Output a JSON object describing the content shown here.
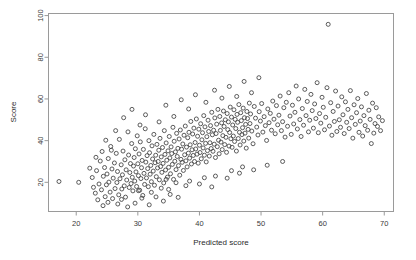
{
  "chart_data": {
    "type": "scatter",
    "title": "",
    "xlabel": "Predicted score",
    "ylabel": "Score",
    "xlim": [
      15.5,
      71.5
    ],
    "ylim": [
      6,
      101
    ],
    "xticks": [
      20,
      30,
      40,
      50,
      60,
      70
    ],
    "yticks": [
      20,
      40,
      60,
      80,
      100
    ],
    "xtick_labels": [
      "20",
      "30",
      "40",
      "50",
      "60",
      "70"
    ],
    "ytick_labels": [
      "20",
      "40",
      "60",
      "80",
      "100"
    ],
    "grid": false,
    "legend": false,
    "marker": "open-circle",
    "marker_size": 4,
    "marker_color": "#404040",
    "n_points": 402,
    "points": [
      [
        17.2,
        20.4
      ],
      [
        20.4,
        20.0
      ],
      [
        22.6,
        22.3
      ],
      [
        22.8,
        17.6
      ],
      [
        23.1,
        14.8
      ],
      [
        23.3,
        25.6
      ],
      [
        23.5,
        11.6
      ],
      [
        23.7,
        19.2
      ],
      [
        23.9,
        30.2
      ],
      [
        24.1,
        16.4
      ],
      [
        24.2,
        34.8
      ],
      [
        24.4,
        22.9
      ],
      [
        24.6,
        27.1
      ],
      [
        24.7,
        13.1
      ],
      [
        24.9,
        18.8
      ],
      [
        25.0,
        24.0
      ],
      [
        25.2,
        31.4
      ],
      [
        25.3,
        20.1
      ],
      [
        25.5,
        15.3
      ],
      [
        25.6,
        37.2
      ],
      [
        25.8,
        26.4
      ],
      [
        25.9,
        12.2
      ],
      [
        26.0,
        22.0
      ],
      [
        26.2,
        29.3
      ],
      [
        26.3,
        17.0
      ],
      [
        26.5,
        33.9
      ],
      [
        26.6,
        19.9
      ],
      [
        26.7,
        25.2
      ],
      [
        26.9,
        14.0
      ],
      [
        27.0,
        40.6
      ],
      [
        27.1,
        21.7
      ],
      [
        27.3,
        28.4
      ],
      [
        27.4,
        16.8
      ],
      [
        27.5,
        23.6
      ],
      [
        27.6,
        35.0
      ],
      [
        27.8,
        18.3
      ],
      [
        27.9,
        30.8
      ],
      [
        28.0,
        12.9
      ],
      [
        28.1,
        26.0
      ],
      [
        28.2,
        21.1
      ],
      [
        28.4,
        44.2
      ],
      [
        28.5,
        33.1
      ],
      [
        28.6,
        17.5
      ],
      [
        28.7,
        24.7
      ],
      [
        28.8,
        29.0
      ],
      [
        28.9,
        19.4
      ],
      [
        29.0,
        38.6
      ],
      [
        29.1,
        22.4
      ],
      [
        29.2,
        15.9
      ],
      [
        29.3,
        27.8
      ],
      [
        29.4,
        31.9
      ],
      [
        29.5,
        20.6
      ],
      [
        29.6,
        36.1
      ],
      [
        29.7,
        25.0
      ],
      [
        29.8,
        18.0
      ],
      [
        29.9,
        42.3
      ],
      [
        30.0,
        28.9
      ],
      [
        30.1,
        23.2
      ],
      [
        30.2,
        33.6
      ],
      [
        30.3,
        16.2
      ],
      [
        30.4,
        39.4
      ],
      [
        30.5,
        21.8
      ],
      [
        30.6,
        27.0
      ],
      [
        30.7,
        30.5
      ],
      [
        30.8,
        13.7
      ],
      [
        30.9,
        35.8
      ],
      [
        31.0,
        24.3
      ],
      [
        31.1,
        19.0
      ],
      [
        31.2,
        45.7
      ],
      [
        31.3,
        29.7
      ],
      [
        31.4,
        22.1
      ],
      [
        31.5,
        32.8
      ],
      [
        31.6,
        26.6
      ],
      [
        31.7,
        17.9
      ],
      [
        31.8,
        40.0
      ],
      [
        31.9,
        34.2
      ],
      [
        32.0,
        23.9
      ],
      [
        32.1,
        28.1
      ],
      [
        32.2,
        20.3
      ],
      [
        32.3,
        37.5
      ],
      [
        32.4,
        31.2
      ],
      [
        32.5,
        25.4
      ],
      [
        32.6,
        43.0
      ],
      [
        32.7,
        18.6
      ],
      [
        32.8,
        29.4
      ],
      [
        32.9,
        33.0
      ],
      [
        33.0,
        22.7
      ],
      [
        33.1,
        38.2
      ],
      [
        33.2,
        26.9
      ],
      [
        33.3,
        30.0
      ],
      [
        33.4,
        35.4
      ],
      [
        33.5,
        21.2
      ],
      [
        33.6,
        41.1
      ],
      [
        33.7,
        27.6
      ],
      [
        33.8,
        32.2
      ],
      [
        33.9,
        24.8
      ],
      [
        34.0,
        36.7
      ],
      [
        34.1,
        29.1
      ],
      [
        34.2,
        19.7
      ],
      [
        34.3,
        44.8
      ],
      [
        34.4,
        33.4
      ],
      [
        34.5,
        25.9
      ],
      [
        34.6,
        38.9
      ],
      [
        34.7,
        30.6
      ],
      [
        34.8,
        22.5
      ],
      [
        34.9,
        35.1
      ],
      [
        35.0,
        27.2
      ],
      [
        35.1,
        42.0
      ],
      [
        35.2,
        31.7
      ],
      [
        35.3,
        24.1
      ],
      [
        35.4,
        37.0
      ],
      [
        35.5,
        33.8
      ],
      [
        35.6,
        28.6
      ],
      [
        35.7,
        46.4
      ],
      [
        35.8,
        21.4
      ],
      [
        35.9,
        39.7
      ],
      [
        36.0,
        30.1
      ],
      [
        36.1,
        34.6
      ],
      [
        36.2,
        26.1
      ],
      [
        36.3,
        43.5
      ],
      [
        36.4,
        32.4
      ],
      [
        36.5,
        36.3
      ],
      [
        36.6,
        28.0
      ],
      [
        36.7,
        40.8
      ],
      [
        36.8,
        23.4
      ],
      [
        36.9,
        45.1
      ],
      [
        37.0,
        31.0
      ],
      [
        37.1,
        35.9
      ],
      [
        37.2,
        29.6
      ],
      [
        37.3,
        38.4
      ],
      [
        37.4,
        25.7
      ],
      [
        37.5,
        42.6
      ],
      [
        37.6,
        33.2
      ],
      [
        37.7,
        47.0
      ],
      [
        37.8,
        30.3
      ],
      [
        37.9,
        36.9
      ],
      [
        38.0,
        27.4
      ],
      [
        38.1,
        41.4
      ],
      [
        38.2,
        34.0
      ],
      [
        38.3,
        44.0
      ],
      [
        38.4,
        31.6
      ],
      [
        38.5,
        38.0
      ],
      [
        38.6,
        49.2
      ],
      [
        38.7,
        28.8
      ],
      [
        38.8,
        35.6
      ],
      [
        38.9,
        43.2
      ],
      [
        39.0,
        32.9
      ],
      [
        39.1,
        46.0
      ],
      [
        39.2,
        30.0
      ],
      [
        39.3,
        39.1
      ],
      [
        39.4,
        36.0
      ],
      [
        39.5,
        50.4
      ],
      [
        39.6,
        33.5
      ],
      [
        39.7,
        42.1
      ],
      [
        39.8,
        29.2
      ],
      [
        39.9,
        45.5
      ],
      [
        40.0,
        37.8
      ],
      [
        40.1,
        34.3
      ],
      [
        40.2,
        48.1
      ],
      [
        40.3,
        31.3
      ],
      [
        40.4,
        40.4
      ],
      [
        40.5,
        43.8
      ],
      [
        40.6,
        36.5
      ],
      [
        40.7,
        52.0
      ],
      [
        40.8,
        33.0
      ],
      [
        40.9,
        46.6
      ],
      [
        41.0,
        38.7
      ],
      [
        41.1,
        29.8
      ],
      [
        41.2,
        41.9
      ],
      [
        41.3,
        35.2
      ],
      [
        41.4,
        49.8
      ],
      [
        41.5,
        44.4
      ],
      [
        41.6,
        32.6
      ],
      [
        41.7,
        39.0
      ],
      [
        41.8,
        47.2
      ],
      [
        41.9,
        36.2
      ],
      [
        42.0,
        53.6
      ],
      [
        42.1,
        42.8
      ],
      [
        42.2,
        34.9
      ],
      [
        42.3,
        45.0
      ],
      [
        42.4,
        38.3
      ],
      [
        42.5,
        50.9
      ],
      [
        42.6,
        31.9
      ],
      [
        42.7,
        43.4
      ],
      [
        42.8,
        47.9
      ],
      [
        42.9,
        37.1
      ],
      [
        43.0,
        55.0
      ],
      [
        43.1,
        40.2
      ],
      [
        43.2,
        33.7
      ],
      [
        43.3,
        51.6
      ],
      [
        43.4,
        44.9
      ],
      [
        43.5,
        39.3
      ],
      [
        43.6,
        48.5
      ],
      [
        43.7,
        35.7
      ],
      [
        43.8,
        42.4
      ],
      [
        43.9,
        54.2
      ],
      [
        44.0,
        46.8
      ],
      [
        44.1,
        38.1
      ],
      [
        44.2,
        50.0
      ],
      [
        44.3,
        41.6
      ],
      [
        44.4,
        34.4
      ],
      [
        44.5,
        53.0
      ],
      [
        44.6,
        45.3
      ],
      [
        44.7,
        49.0
      ],
      [
        44.8,
        37.4
      ],
      [
        44.9,
        43.9
      ],
      [
        45.0,
        56.1
      ],
      [
        45.1,
        40.9
      ],
      [
        45.2,
        51.3
      ],
      [
        45.3,
        36.8
      ],
      [
        45.4,
        47.5
      ],
      [
        45.5,
        42.2
      ],
      [
        45.6,
        54.8
      ],
      [
        45.7,
        39.6
      ],
      [
        45.8,
        50.2
      ],
      [
        45.9,
        45.8
      ],
      [
        46.0,
        35.0
      ],
      [
        46.1,
        52.6
      ],
      [
        46.2,
        48.8
      ],
      [
        46.3,
        41.0
      ],
      [
        46.4,
        57.3
      ],
      [
        46.5,
        44.0
      ],
      [
        46.6,
        37.9
      ],
      [
        46.7,
        53.4
      ],
      [
        46.8,
        49.6
      ],
      [
        46.9,
        42.9
      ],
      [
        47.0,
        46.2
      ],
      [
        47.1,
        55.6
      ],
      [
        47.2,
        39.8
      ],
      [
        47.3,
        51.0
      ],
      [
        47.4,
        43.6
      ],
      [
        47.5,
        47.8
      ],
      [
        47.6,
        36.4
      ],
      [
        47.7,
        54.0
      ],
      [
        47.8,
        50.6
      ],
      [
        47.9,
        45.4
      ],
      [
        48.0,
        41.2
      ],
      [
        48.1,
        58.0
      ],
      [
        48.2,
        48.2
      ],
      [
        48.3,
        52.8
      ],
      [
        48.5,
        44.6
      ],
      [
        48.7,
        38.5
      ],
      [
        48.9,
        56.4
      ],
      [
        49.1,
        50.8
      ],
      [
        49.3,
        46.5
      ],
      [
        49.5,
        42.7
      ],
      [
        49.7,
        53.9
      ],
      [
        49.9,
        49.4
      ],
      [
        50.1,
        57.8
      ],
      [
        50.3,
        44.1
      ],
      [
        50.5,
        51.5
      ],
      [
        50.7,
        47.2
      ],
      [
        50.9,
        40.1
      ],
      [
        51.1,
        55.2
      ],
      [
        51.3,
        48.6
      ],
      [
        51.5,
        53.1
      ],
      [
        51.7,
        45.0
      ],
      [
        51.9,
        59.0
      ],
      [
        52.1,
        50.3
      ],
      [
        52.3,
        43.3
      ],
      [
        52.5,
        56.8
      ],
      [
        52.7,
        47.6
      ],
      [
        52.9,
        52.2
      ],
      [
        53.1,
        61.4
      ],
      [
        53.3,
        44.8
      ],
      [
        53.5,
        49.1
      ],
      [
        53.7,
        55.8
      ],
      [
        53.9,
        41.7
      ],
      [
        54.1,
        58.4
      ],
      [
        54.3,
        46.9
      ],
      [
        54.5,
        63.0
      ],
      [
        54.7,
        51.8
      ],
      [
        54.9,
        43.0
      ],
      [
        55.1,
        57.0
      ],
      [
        55.3,
        48.0
      ],
      [
        55.5,
        53.6
      ],
      [
        55.7,
        66.2
      ],
      [
        55.9,
        45.6
      ],
      [
        56.1,
        60.0
      ],
      [
        56.3,
        50.1
      ],
      [
        56.5,
        42.0
      ],
      [
        56.7,
        55.4
      ],
      [
        56.9,
        47.4
      ],
      [
        57.1,
        64.6
      ],
      [
        57.3,
        52.0
      ],
      [
        57.5,
        58.8
      ],
      [
        57.7,
        44.2
      ],
      [
        57.9,
        49.8
      ],
      [
        58.1,
        62.2
      ],
      [
        58.3,
        54.4
      ],
      [
        58.5,
        46.0
      ],
      [
        58.7,
        57.6
      ],
      [
        58.9,
        50.6
      ],
      [
        59.1,
        67.8
      ],
      [
        59.3,
        43.8
      ],
      [
        59.5,
        53.0
      ],
      [
        59.7,
        48.4
      ],
      [
        59.9,
        60.8
      ],
      [
        60.1,
        56.0
      ],
      [
        60.3,
        45.2
      ],
      [
        60.5,
        51.2
      ],
      [
        60.7,
        65.4
      ],
      [
        60.9,
        95.8
      ],
      [
        61.1,
        47.0
      ],
      [
        61.3,
        58.2
      ],
      [
        61.5,
        42.6
      ],
      [
        61.7,
        54.0
      ],
      [
        61.9,
        49.2
      ],
      [
        62.1,
        63.8
      ],
      [
        62.3,
        44.4
      ],
      [
        62.5,
        56.6
      ],
      [
        62.7,
        50.0
      ],
      [
        62.9,
        46.4
      ],
      [
        63.1,
        61.0
      ],
      [
        63.3,
        52.4
      ],
      [
        63.5,
        43.4
      ],
      [
        63.7,
        58.6
      ],
      [
        63.9,
        48.8
      ],
      [
        64.1,
        55.0
      ],
      [
        64.3,
        45.8
      ],
      [
        64.5,
        64.0
      ],
      [
        64.7,
        51.0
      ],
      [
        64.9,
        41.2
      ],
      [
        65.1,
        57.2
      ],
      [
        65.3,
        47.8
      ],
      [
        65.5,
        53.4
      ],
      [
        65.7,
        60.2
      ],
      [
        65.9,
        44.0
      ],
      [
        66.1,
        49.4
      ],
      [
        66.3,
        56.2
      ],
      [
        66.5,
        42.2
      ],
      [
        66.7,
        52.0
      ],
      [
        66.9,
        47.2
      ],
      [
        67.1,
        62.6
      ],
      [
        67.3,
        45.0
      ],
      [
        67.5,
        54.6
      ],
      [
        67.7,
        50.2
      ],
      [
        67.9,
        38.6
      ],
      [
        68.1,
        58.0
      ],
      [
        68.3,
        43.6
      ],
      [
        68.5,
        48.2
      ],
      [
        68.7,
        55.8
      ],
      [
        68.9,
        46.8
      ],
      [
        69.1,
        51.4
      ],
      [
        69.4,
        44.8
      ],
      [
        69.7,
        49.6
      ],
      [
        26.4,
        44.8
      ],
      [
        27.7,
        51.0
      ],
      [
        29.05,
        55.0
      ],
      [
        30.35,
        47.5
      ],
      [
        31.25,
        52.4
      ],
      [
        33.45,
        49.0
      ],
      [
        34.55,
        57.0
      ],
      [
        35.85,
        51.6
      ],
      [
        37.05,
        59.6
      ],
      [
        38.25,
        55.2
      ],
      [
        39.35,
        62.0
      ],
      [
        41.05,
        58.4
      ],
      [
        42.45,
        64.2
      ],
      [
        43.65,
        60.4
      ],
      [
        44.85,
        66.0
      ],
      [
        46.05,
        61.2
      ],
      [
        47.25,
        68.4
      ],
      [
        48.45,
        63.0
      ],
      [
        49.65,
        70.2
      ],
      [
        24.8,
        40.2
      ],
      [
        25.7,
        35.4
      ],
      [
        22.2,
        26.8
      ],
      [
        23.2,
        32.0
      ],
      [
        24.35,
        8.8
      ],
      [
        25.15,
        10.4
      ],
      [
        26.75,
        9.6
      ],
      [
        27.35,
        11.8
      ],
      [
        28.35,
        8.2
      ],
      [
        29.55,
        10.0
      ],
      [
        30.65,
        12.4
      ],
      [
        31.85,
        9.2
      ],
      [
        32.95,
        13.0
      ],
      [
        34.15,
        11.0
      ],
      [
        35.25,
        14.2
      ],
      [
        36.55,
        12.8
      ],
      [
        30.1,
        16.0
      ],
      [
        32.2,
        15.2
      ],
      [
        33.8,
        17.2
      ],
      [
        35.0,
        16.6
      ],
      [
        37.8,
        18.4
      ],
      [
        40.0,
        19.2
      ],
      [
        42.0,
        17.8
      ],
      [
        44.5,
        22.0
      ],
      [
        46.5,
        24.4
      ],
      [
        48.8,
        26.0
      ],
      [
        51.0,
        28.2
      ],
      [
        53.5,
        30.0
      ],
      [
        38.4,
        20.6
      ],
      [
        36.2,
        19.8
      ],
      [
        34.6,
        21.4
      ],
      [
        42.6,
        23.0
      ],
      [
        40.8,
        22.2
      ],
      [
        45.2,
        25.6
      ],
      [
        47.0,
        27.4
      ]
    ]
  }
}
